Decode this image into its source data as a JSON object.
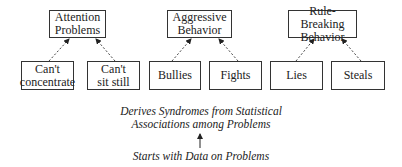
{
  "syndromes": [
    {
      "id": "attention",
      "label_lines": [
        "Attention",
        "Problems"
      ],
      "problems": [
        {
          "label_lines": [
            "Can't",
            "concentrate"
          ]
        },
        {
          "label_lines": [
            "Can't",
            "sit still"
          ]
        }
      ]
    },
    {
      "id": "aggressive",
      "label_lines": [
        "Aggressive",
        "Behavior"
      ],
      "problems": [
        {
          "label_lines": [
            "Bullies"
          ]
        },
        {
          "label_lines": [
            "Fights"
          ]
        }
      ]
    },
    {
      "id": "rule-breaking",
      "label_lines": [
        "Rule-Breaking",
        "Behavior"
      ],
      "problems": [
        {
          "label_lines": [
            "Lies"
          ]
        },
        {
          "label_lines": [
            "Steals"
          ]
        }
      ]
    }
  ],
  "captions": {
    "derives_line1": "Derives Syndromes from Statistical",
    "derives_line2": "Associations among Problems",
    "starts": "Starts with Data on Problems"
  },
  "arrow_glyph": "up-arrow"
}
